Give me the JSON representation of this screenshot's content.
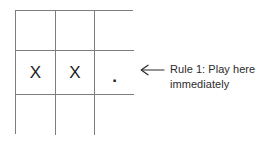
{
  "canvas": {
    "width": 271,
    "height": 144,
    "background": "#ffffff"
  },
  "board": {
    "title": "tic-tac-toe-board",
    "rows": 3,
    "cols": 3,
    "line_color": "#7d7d7d",
    "mark_color": "#1c1c1c",
    "cells": [
      [
        {
          "value": "",
          "kind": "empty"
        },
        {
          "value": "",
          "kind": "empty"
        },
        {
          "value": "",
          "kind": "empty"
        }
      ],
      [
        {
          "value": "X",
          "kind": "x"
        },
        {
          "value": "X",
          "kind": "x"
        },
        {
          "value": ".",
          "kind": "dot"
        }
      ],
      [
        {
          "value": "",
          "kind": "empty"
        },
        {
          "value": "",
          "kind": "empty"
        },
        {
          "value": "",
          "kind": "empty"
        }
      ]
    ]
  },
  "annotation": {
    "arrow_icon": "arrow-left-icon",
    "arrow_color": "#2b2b2b",
    "line1": "Rule 1: Play here",
    "line2": "immediately",
    "text_color": "#2b2b2b"
  }
}
